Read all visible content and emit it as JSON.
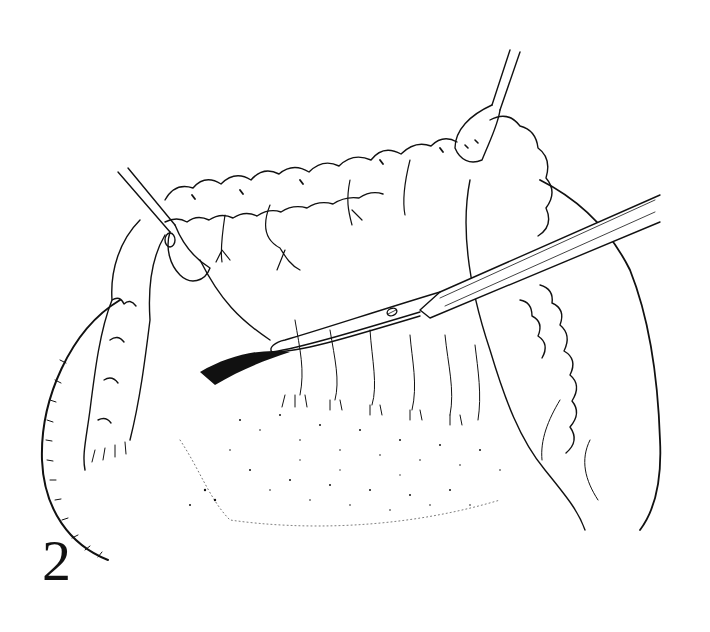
{
  "figure": {
    "label": "2",
    "colors": {
      "ink": "#111111",
      "background": "#ffffff"
    },
    "elements": [
      {
        "name": "left-clamp",
        "type": "hemostat"
      },
      {
        "name": "right-clamp",
        "type": "hemostat"
      },
      {
        "name": "scissors",
        "type": "curved dissecting scissors"
      },
      {
        "name": "omentum-fatty-border",
        "type": "tissue"
      },
      {
        "name": "stippled-surface",
        "type": "tissue"
      }
    ]
  }
}
